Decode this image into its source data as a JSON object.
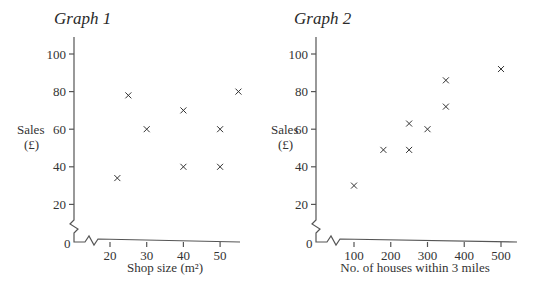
{
  "chart_data": [
    {
      "type": "scatter",
      "title": "Graph 1",
      "xlabel": "Shop size (m²)",
      "ylabel": "Sales (£)",
      "xlim": [
        10,
        57
      ],
      "ylim": [
        0,
        105
      ],
      "x_ticks": [
        20,
        30,
        40,
        50
      ],
      "y_ticks": [
        0,
        20,
        40,
        60,
        80,
        100
      ],
      "grid": false,
      "axis_breaks": [
        "x",
        "y"
      ],
      "marker": "x",
      "points": [
        {
          "x": 22,
          "y": 34
        },
        {
          "x": 25,
          "y": 78
        },
        {
          "x": 30,
          "y": 60
        },
        {
          "x": 40,
          "y": 70
        },
        {
          "x": 40,
          "y": 40
        },
        {
          "x": 50,
          "y": 60
        },
        {
          "x": 50,
          "y": 40
        },
        {
          "x": 55,
          "y": 80
        }
      ]
    },
    {
      "type": "scatter",
      "title": "Graph 2",
      "xlabel": "No. of houses within 3 miles",
      "ylabel": "Sales (£)",
      "xlim": [
        0,
        545
      ],
      "ylim": [
        0,
        105
      ],
      "x_ticks": [
        100,
        200,
        300,
        400,
        500
      ],
      "y_ticks": [
        0,
        20,
        40,
        60,
        80,
        100
      ],
      "grid": false,
      "axis_breaks": [
        "x",
        "y"
      ],
      "marker": "x",
      "points": [
        {
          "x": 100,
          "y": 30
        },
        {
          "x": 180,
          "y": 49
        },
        {
          "x": 250,
          "y": 49
        },
        {
          "x": 250,
          "y": 63
        },
        {
          "x": 300,
          "y": 60
        },
        {
          "x": 350,
          "y": 72
        },
        {
          "x": 350,
          "y": 86
        },
        {
          "x": 500,
          "y": 92
        }
      ]
    }
  ],
  "graph1": {
    "title": "Graph 1",
    "ylabel_line1": "Sales",
    "ylabel_line2": "(£)",
    "xlabel": "Shop size (m²)",
    "origin_label": "0"
  },
  "graph2": {
    "title": "Graph 2",
    "ylabel_line1": "Sales",
    "ylabel_line2": "(£)",
    "xlabel": "No. of houses within 3 miles",
    "origin_label": "0"
  }
}
